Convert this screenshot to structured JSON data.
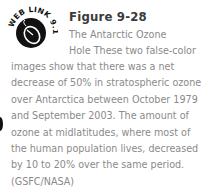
{
  "icon": {
    "name": "web-link-mouse-icon",
    "label": "WEB LINK 9.10"
  },
  "figure": {
    "number": "Figure 9-28",
    "caption_lines_top": [
      "The Antarctic Ozone",
      "Hole These two false-color"
    ],
    "caption_lines_body": [
      "images show that there was a net",
      "decrease of 50% in stratospheric ozone",
      "over Antarctica between October 1979",
      "and September 2003. The amount of",
      "ozone at midlatitudes, where most of",
      "the human population lives, decreased",
      "by 10 to 20% over the same period.",
      "(GSFC/NASA)"
    ]
  },
  "colors": {
    "title": "#3a3a3a",
    "caption": "#8a8a8a",
    "icon": "#111111"
  }
}
